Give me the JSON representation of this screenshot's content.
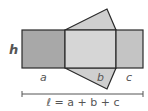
{
  "diagram": {
    "labels": {
      "height": "h",
      "side_a": "a",
      "side_b": "b",
      "side_c": "c",
      "length_formula": "ℓ = a + b + c"
    },
    "colors": {
      "face_a": "#a8a8a8",
      "face_b": "#d6d6d6",
      "face_c": "#c4c4c4",
      "triangle": "#cfcfcf",
      "stroke": "#2a2a2a",
      "dimension_line": "#555555"
    }
  }
}
